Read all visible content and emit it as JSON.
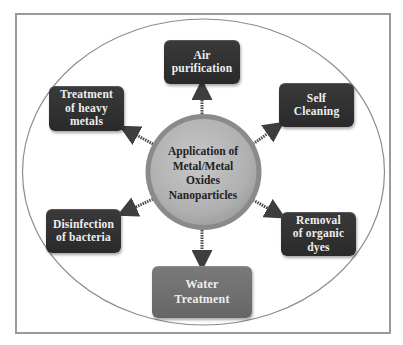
{
  "diagram": {
    "center": {
      "lines": [
        "Application of",
        "Metal/Metal",
        "Oxides",
        "Nanoparticles"
      ],
      "fill_color": "#b4b4b4",
      "ring_color": "#8a8a8a"
    },
    "nodes": [
      {
        "id": "air-purification",
        "lines": [
          "Air",
          "purification"
        ],
        "position": "top"
      },
      {
        "id": "self-cleaning",
        "lines": [
          "Self",
          "Cleaning"
        ],
        "position": "top-right"
      },
      {
        "id": "treatment-heavy-metals",
        "lines": [
          "Treatment",
          "of heavy",
          "metals"
        ],
        "position": "top-left"
      },
      {
        "id": "disinfection-bacteria",
        "lines": [
          "Disinfection",
          "of bacteria"
        ],
        "position": "bottom-left"
      },
      {
        "id": "removal-organic-dyes",
        "lines": [
          "Removal",
          "of organic",
          "dyes"
        ],
        "position": "bottom-right"
      },
      {
        "id": "water-treatment",
        "lines": [
          "Water",
          "Treatment"
        ],
        "position": "bottom"
      }
    ],
    "colors": {
      "box_dark": "#333333",
      "box_light": "#707070",
      "box_text": "#efefef",
      "arrow": "#555555",
      "ellipse_stroke": "#8c8c8c",
      "frame_stroke": "#9a9a9a"
    }
  }
}
